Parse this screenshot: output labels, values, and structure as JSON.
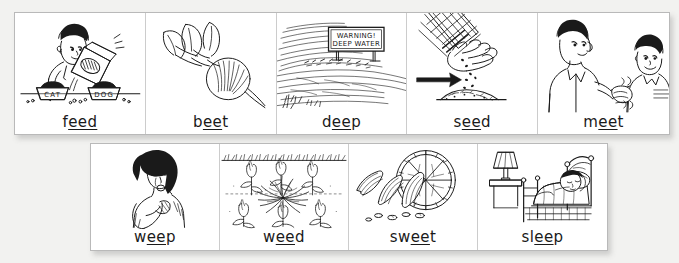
{
  "document": {
    "kind": "phonics-flashcard-strips",
    "theme": "long-e spelling: ee",
    "background_color": "#f2f2f0",
    "card_color": "#ffffff",
    "ink_color": "#1a1a1a"
  },
  "strips": [
    {
      "id": "top",
      "cards": [
        {
          "word_prefix": "f",
          "word_underlined": "eed",
          "word_suffix": "",
          "word_full": "feed",
          "illustration": "boy-pouring-pet-food-into-cat-and-dog-bowls",
          "labels_in_art": [
            "CAT",
            "DOG"
          ]
        },
        {
          "word_prefix": "b",
          "word_underlined": "ee",
          "word_suffix": "t",
          "word_full": "beet",
          "illustration": "beet-root-with-leafy-greens",
          "labels_in_art": []
        },
        {
          "word_prefix": "d",
          "word_underlined": "ee",
          "word_suffix": "p",
          "word_full": "deep",
          "illustration": "river-with-warning-sign",
          "labels_in_art": [
            "WARNING!",
            "DEEP WATER"
          ]
        },
        {
          "word_prefix": "s",
          "word_underlined": "ee",
          "word_suffix": "d",
          "word_full": "seed",
          "illustration": "hand-dropping-seeds-onto-soil-with-arrow",
          "labels_in_art": []
        },
        {
          "word_prefix": "m",
          "word_underlined": "ee",
          "word_suffix": "t",
          "word_full": "meet",
          "illustration": "man-and-boy-shaking-hands",
          "labels_in_art": []
        }
      ]
    },
    {
      "id": "bottom",
      "cards": [
        {
          "word_prefix": "w",
          "word_underlined": "ee",
          "word_suffix": "p",
          "word_full": "weep",
          "illustration": "crying-woman-wiping-tears",
          "labels_in_art": []
        },
        {
          "word_prefix": "w",
          "word_underlined": "ee",
          "word_suffix": "d",
          "word_full": "weed",
          "illustration": "weed-growing-among-tulips",
          "labels_in_art": []
        },
        {
          "word_prefix": "sw",
          "word_underlined": "ee",
          "word_suffix": "t",
          "word_full": "sweet",
          "illustration": "sliced-orange-fruit-wedges",
          "labels_in_art": []
        },
        {
          "word_prefix": "sl",
          "word_underlined": "ee",
          "word_suffix": "p",
          "word_full": "sleep",
          "illustration": "person-sleeping-in-bed-with-lamp",
          "labels_in_art": []
        }
      ]
    }
  ]
}
